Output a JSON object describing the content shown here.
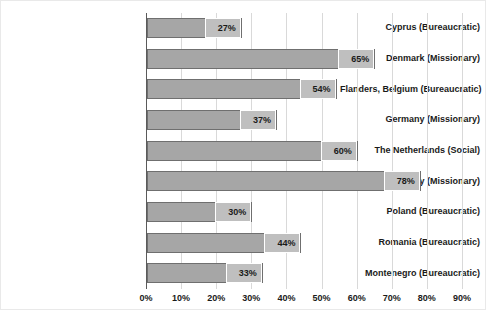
{
  "chart_data": {
    "type": "bar",
    "orientation": "horizontal",
    "title": "",
    "subtitle": "",
    "xlabel": "",
    "ylabel": "",
    "xlim": [
      0,
      90
    ],
    "xtick_labels": [
      "0%",
      "10%",
      "20%",
      "30%",
      "40%",
      "50%",
      "60%",
      "70%",
      "80%",
      "90%"
    ],
    "xticks": [
      0,
      10,
      20,
      30,
      40,
      50,
      60,
      70,
      80,
      90
    ],
    "grid": true,
    "grid_axis": "x",
    "legend": false,
    "legend_position": "none",
    "value_labels_shown": true,
    "value_label_suffix": "%",
    "categories": [
      "Cyprus (Bureaucratic)",
      "Denmark (Missionary)",
      "Flanders, Belgium (Bureaucratic)",
      "Germany (Missionary)",
      "The Netherlands (Social)",
      "Norway (Missionary)",
      "Poland (Bureaucratic)",
      "Romania (Bureaucratic)",
      "Montenegro (Bureaucratic)"
    ],
    "values": [
      27,
      65,
      54,
      37,
      60,
      78,
      30,
      44,
      33
    ],
    "value_labels": [
      "27%",
      "65%",
      "54%",
      "37%",
      "60%",
      "78%",
      "30%",
      "44%",
      "33%"
    ],
    "series": [
      {
        "name": "",
        "values": [
          27,
          65,
          54,
          37,
          60,
          78,
          30,
          44,
          33
        ]
      }
    ]
  },
  "style": {
    "bar_fill": "#a6a6a6",
    "bar_border": "#6f6f6f",
    "label_box_fill": "#bfbfbf",
    "label_box_border": "#ffffff",
    "gridline_color": "#d9d9d9",
    "axis_color": "#5a5a5a",
    "text_color": "#1a1a1a",
    "plot_background": "#ffffff",
    "frame_border": "#e9e9e9"
  }
}
